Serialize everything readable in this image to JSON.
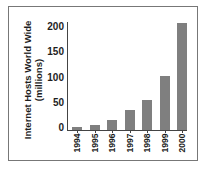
{
  "chart_data": {
    "type": "bar",
    "title": "",
    "xlabel": "",
    "ylabel": "Internet Hosts World Wide (millions)",
    "ylabel_lines": [
      "Internet Hosts World Wide",
      "(millions)"
    ],
    "categories": [
      "1994",
      "1995",
      "1996",
      "1997",
      "1998",
      "1999",
      "2000"
    ],
    "values": [
      5,
      9,
      19,
      38,
      58,
      105,
      208
    ],
    "ylim": [
      0,
      210
    ],
    "yticks": [
      "200",
      "150",
      "100",
      "50",
      "0"
    ],
    "grid": false,
    "legend": null,
    "bar_color": "#7f7f7f"
  }
}
